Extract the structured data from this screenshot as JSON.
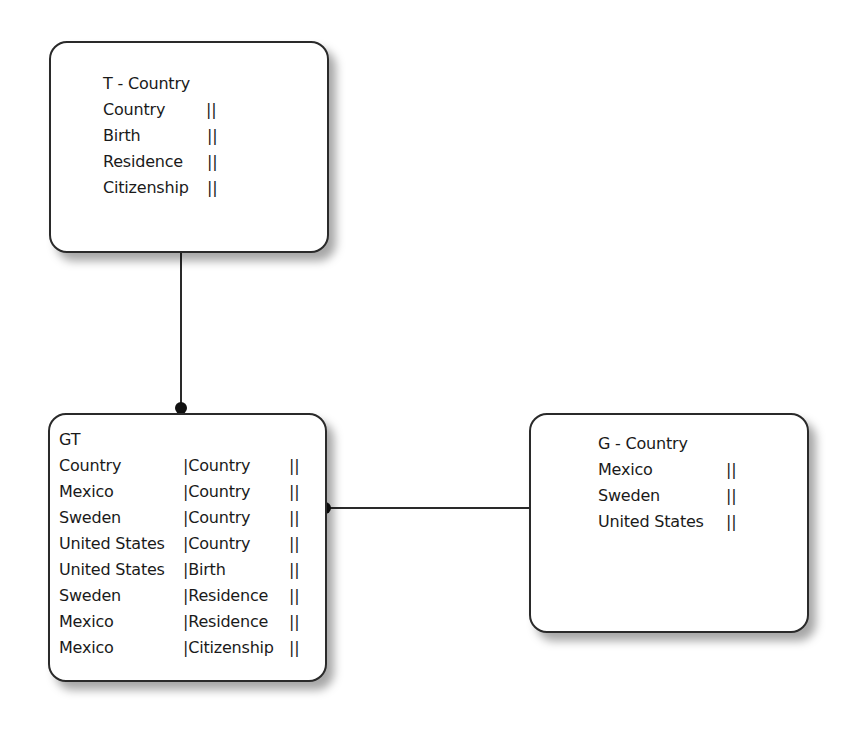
{
  "diagram": {
    "type": "entity-relationship",
    "background_color": "#ffffff",
    "border_color": "#2a2a2a"
  },
  "entities": {
    "t_country": {
      "title": "T - Country",
      "rows": [
        {
          "name": "Country",
          "marker": "||"
        },
        {
          "name": "Birth",
          "marker": "||"
        },
        {
          "name": "Residence",
          "marker": "||"
        },
        {
          "name": "Citizenship",
          "marker": "||"
        }
      ]
    },
    "gt": {
      "title": "GT",
      "rows": [
        {
          "col1": "Country",
          "col2": "|Country",
          "marker": "||"
        },
        {
          "col1": "Mexico",
          "col2": "|Country",
          "marker": "||"
        },
        {
          "col1": "Sweden",
          "col2": "|Country",
          "marker": "||"
        },
        {
          "col1": "United States",
          "col2": "|Country",
          "marker": "||"
        },
        {
          "col1": "United States",
          "col2": "|Birth",
          "marker": "||"
        },
        {
          "col1": "Sweden",
          "col2": "|Residence",
          "marker": "||"
        },
        {
          "col1": "Mexico",
          "col2": "|Residence",
          "marker": "||"
        },
        {
          "col1": "Mexico",
          "col2": "|Citizenship",
          "marker": "||"
        }
      ]
    },
    "g_country": {
      "title": "G - Country",
      "rows": [
        {
          "name": "Mexico",
          "marker": "||"
        },
        {
          "name": "Sweden",
          "marker": "||"
        },
        {
          "name": "United States",
          "marker": "||"
        }
      ]
    }
  },
  "relationships": [
    {
      "from": "T - Country",
      "to": "GT",
      "end": "dot-at-GT"
    },
    {
      "from": "G - Country",
      "to": "GT",
      "end": "dot-at-GT"
    }
  ]
}
